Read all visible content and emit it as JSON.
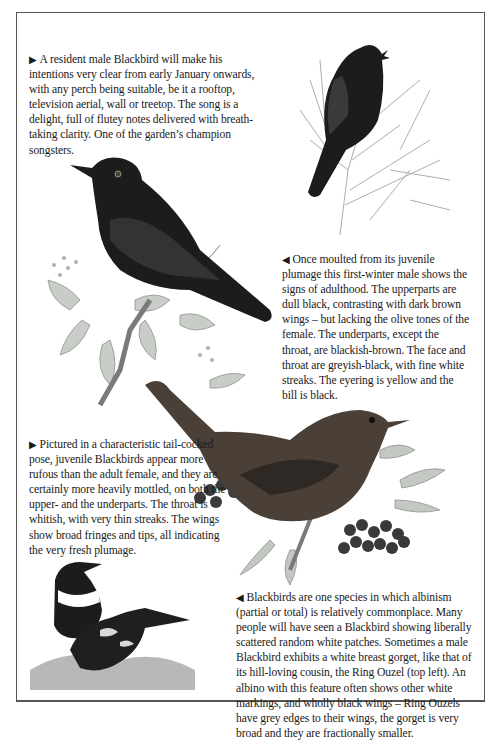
{
  "page": {
    "colors": {
      "background": "#ffffff",
      "text": "#1a1a1a",
      "frame": "#555555",
      "blackbird_plumage": "#1c1c1c",
      "juvenile_plumage": "#4a4038",
      "berries": "#3a3a3a",
      "foliage": "#a9b0a8"
    },
    "captions": [
      {
        "pointer": "right-arrow",
        "pointer_glyph": "▶",
        "text": "A resident male Blackbird will make his intentions very clear from early January onwards, with any perch being suitable, be it a rooftop, television aerial, wall or treetop. The song is a delight, full of flutey notes delivered with breath-taking clarity. One of the garden’s champion songsters."
      },
      {
        "pointer": "left-arrow",
        "pointer_glyph": "◀",
        "text": "Once moulted from its juvenile plumage this first-winter male shows the signs of adulthood. The upperparts are dull black, contrasting with dark brown wings – but lacking the olive tones of the female. The underparts, except the throat, are blackish-brown. The face and throat are greyish-black, with fine white streaks. The eyering is yellow and the bill is black."
      },
      {
        "pointer": "right-arrow",
        "pointer_glyph": "▶",
        "text": "Pictured in a characteristic tail-cocked pose, juvenile Blackbirds appear more rufous than the adult female, and they are certainly more heavily mottled, on both the upper- and the underparts. The throat is whitish, with very thin streaks. The wings show broad fringes and tips, all indicating the very fresh plumage."
      },
      {
        "pointer": "left-arrow",
        "pointer_glyph": "◀",
        "text": "Blackbirds are one species in which albinism (partial or total) is relatively commonplace. Many people will have seen a Blackbird showing liberally scattered random white patches. Sometimes a male Blackbird exhibits a white breast gorget, like that of its hill-loving cousin, the Ring Ouzel (top left). An albino with this feature often shows other white markings, and wholly black wings – Ring Ouzels have grey edges to their wings, the gorget is very broad and they are fractionally smaller."
      }
    ],
    "illustrations": [
      {
        "subject": "singing male blackbird perched on bare twigs"
      },
      {
        "subject": "first-winter male blackbird on ivy branch"
      },
      {
        "subject": "juvenile blackbird with rowan berries"
      },
      {
        "subject": "ring ouzel and partially albino blackbird on grass"
      }
    ]
  }
}
